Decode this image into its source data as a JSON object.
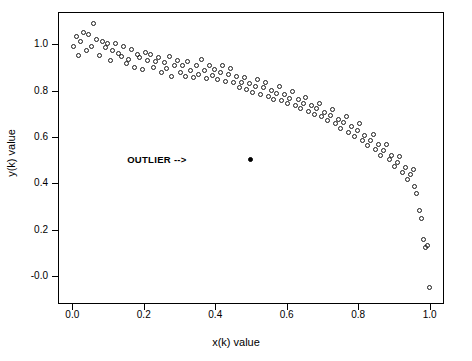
{
  "chart_data": {
    "type": "scatter",
    "title": "",
    "xlabel": "x(k) value",
    "ylabel": "y(k) value",
    "xlim": [
      -0.04,
      1.04
    ],
    "ylim": [
      -0.12,
      1.14
    ],
    "xticks": [
      0.0,
      0.2,
      0.4,
      0.6,
      0.8,
      1.0
    ],
    "xticklabels": [
      "0.0",
      "0.2",
      "0.4",
      "0.6",
      "0.8",
      "1.0"
    ],
    "yticks": [
      -0.0,
      0.2,
      0.4,
      0.6,
      0.8,
      1.0
    ],
    "yticklabels": [
      "-0.0",
      "0.2",
      "0.4",
      "0.6",
      "0.8",
      "1.0"
    ],
    "grid": false,
    "legend": null,
    "marker": "open-circle",
    "annotations": [
      {
        "text": "OUTLIER -->",
        "x": 0.355,
        "y": 0.5
      }
    ],
    "series": [
      {
        "name": "data",
        "marker": "open-circle",
        "points": [
          [
            0.005,
            0.99
          ],
          [
            0.012,
            1.03
          ],
          [
            0.018,
            0.95
          ],
          [
            0.025,
            1.01
          ],
          [
            0.032,
            1.05
          ],
          [
            0.04,
            0.97
          ],
          [
            0.047,
            1.04
          ],
          [
            0.055,
            0.99
          ],
          [
            0.062,
            1.09
          ],
          [
            0.07,
            1.02
          ],
          [
            0.078,
            0.95
          ],
          [
            0.085,
            1.01
          ],
          [
            0.093,
            0.985
          ],
          [
            0.1,
            1.0
          ],
          [
            0.108,
            0.93
          ],
          [
            0.115,
            0.97
          ],
          [
            0.122,
            1.0
          ],
          [
            0.13,
            0.96
          ],
          [
            0.138,
            0.945
          ],
          [
            0.145,
            0.99
          ],
          [
            0.152,
            0.915
          ],
          [
            0.16,
            0.935
          ],
          [
            0.168,
            0.975
          ],
          [
            0.175,
            0.9
          ],
          [
            0.183,
            0.955
          ],
          [
            0.19,
            0.94
          ],
          [
            0.198,
            0.89
          ],
          [
            0.205,
            0.965
          ],
          [
            0.213,
            0.93
          ],
          [
            0.22,
            0.955
          ],
          [
            0.228,
            0.9
          ],
          [
            0.235,
            0.925
          ],
          [
            0.243,
            0.94
          ],
          [
            0.25,
            0.875
          ],
          [
            0.258,
            0.92
          ],
          [
            0.265,
            0.895
          ],
          [
            0.273,
            0.945
          ],
          [
            0.28,
            0.86
          ],
          [
            0.288,
            0.905
          ],
          [
            0.295,
            0.93
          ],
          [
            0.303,
            0.875
          ],
          [
            0.31,
            0.905
          ],
          [
            0.318,
            0.86
          ],
          [
            0.325,
            0.925
          ],
          [
            0.333,
            0.885
          ],
          [
            0.34,
            0.855
          ],
          [
            0.348,
            0.905
          ],
          [
            0.355,
            0.87
          ],
          [
            0.363,
            0.935
          ],
          [
            0.37,
            0.885
          ],
          [
            0.378,
            0.85
          ],
          [
            0.385,
            0.905
          ],
          [
            0.393,
            0.865
          ],
          [
            0.4,
            0.89
          ],
          [
            0.408,
            0.845
          ],
          [
            0.415,
            0.875
          ],
          [
            0.423,
            0.905
          ],
          [
            0.43,
            0.84
          ],
          [
            0.438,
            0.87
          ],
          [
            0.445,
            0.895
          ],
          [
            0.453,
            0.835
          ],
          [
            0.46,
            0.86
          ],
          [
            0.468,
            0.81
          ],
          [
            0.475,
            0.835
          ],
          [
            0.483,
            0.855
          ],
          [
            0.49,
            0.805
          ],
          [
            0.498,
            0.83
          ],
          [
            0.505,
            0.79
          ],
          [
            0.513,
            0.815
          ],
          [
            0.52,
            0.845
          ],
          [
            0.528,
            0.78
          ],
          [
            0.535,
            0.81
          ],
          [
            0.543,
            0.835
          ],
          [
            0.55,
            0.775
          ],
          [
            0.558,
            0.8
          ],
          [
            0.565,
            0.76
          ],
          [
            0.573,
            0.785
          ],
          [
            0.58,
            0.815
          ],
          [
            0.588,
            0.755
          ],
          [
            0.595,
            0.78
          ],
          [
            0.603,
            0.745
          ],
          [
            0.61,
            0.765
          ],
          [
            0.618,
            0.795
          ],
          [
            0.625,
            0.735
          ],
          [
            0.633,
            0.76
          ],
          [
            0.64,
            0.72
          ],
          [
            0.648,
            0.745
          ],
          [
            0.655,
            0.77
          ],
          [
            0.663,
            0.71
          ],
          [
            0.67,
            0.735
          ],
          [
            0.678,
            0.695
          ],
          [
            0.685,
            0.72
          ],
          [
            0.693,
            0.745
          ],
          [
            0.7,
            0.685
          ],
          [
            0.708,
            0.705
          ],
          [
            0.715,
            0.67
          ],
          [
            0.723,
            0.69
          ],
          [
            0.73,
            0.715
          ],
          [
            0.738,
            0.655
          ],
          [
            0.745,
            0.675
          ],
          [
            0.753,
            0.635
          ],
          [
            0.76,
            0.66
          ],
          [
            0.768,
            0.685
          ],
          [
            0.775,
            0.62
          ],
          [
            0.783,
            0.645
          ],
          [
            0.79,
            0.6
          ],
          [
            0.798,
            0.625
          ],
          [
            0.805,
            0.655
          ],
          [
            0.813,
            0.585
          ],
          [
            0.82,
            0.605
          ],
          [
            0.828,
            0.56
          ],
          [
            0.835,
            0.585
          ],
          [
            0.843,
            0.61
          ],
          [
            0.85,
            0.545
          ],
          [
            0.858,
            0.565
          ],
          [
            0.865,
            0.52
          ],
          [
            0.873,
            0.54
          ],
          [
            0.88,
            0.565
          ],
          [
            0.888,
            0.5
          ],
          [
            0.895,
            0.52
          ],
          [
            0.903,
            0.47
          ],
          [
            0.91,
            0.49
          ],
          [
            0.918,
            0.515
          ],
          [
            0.925,
            0.445
          ],
          [
            0.933,
            0.465
          ],
          [
            0.94,
            0.415
          ],
          [
            0.948,
            0.435
          ],
          [
            0.955,
            0.46
          ],
          [
            0.96,
            0.385
          ],
          [
            0.965,
            0.355
          ],
          [
            0.972,
            0.28
          ],
          [
            0.978,
            0.245
          ],
          [
            0.985,
            0.155
          ],
          [
            0.99,
            0.12
          ],
          [
            0.995,
            0.13
          ],
          [
            1.0,
            -0.05
          ]
        ]
      },
      {
        "name": "outlier",
        "marker": "filled-circle",
        "points": [
          [
            0.5,
            0.5
          ]
        ]
      }
    ]
  }
}
